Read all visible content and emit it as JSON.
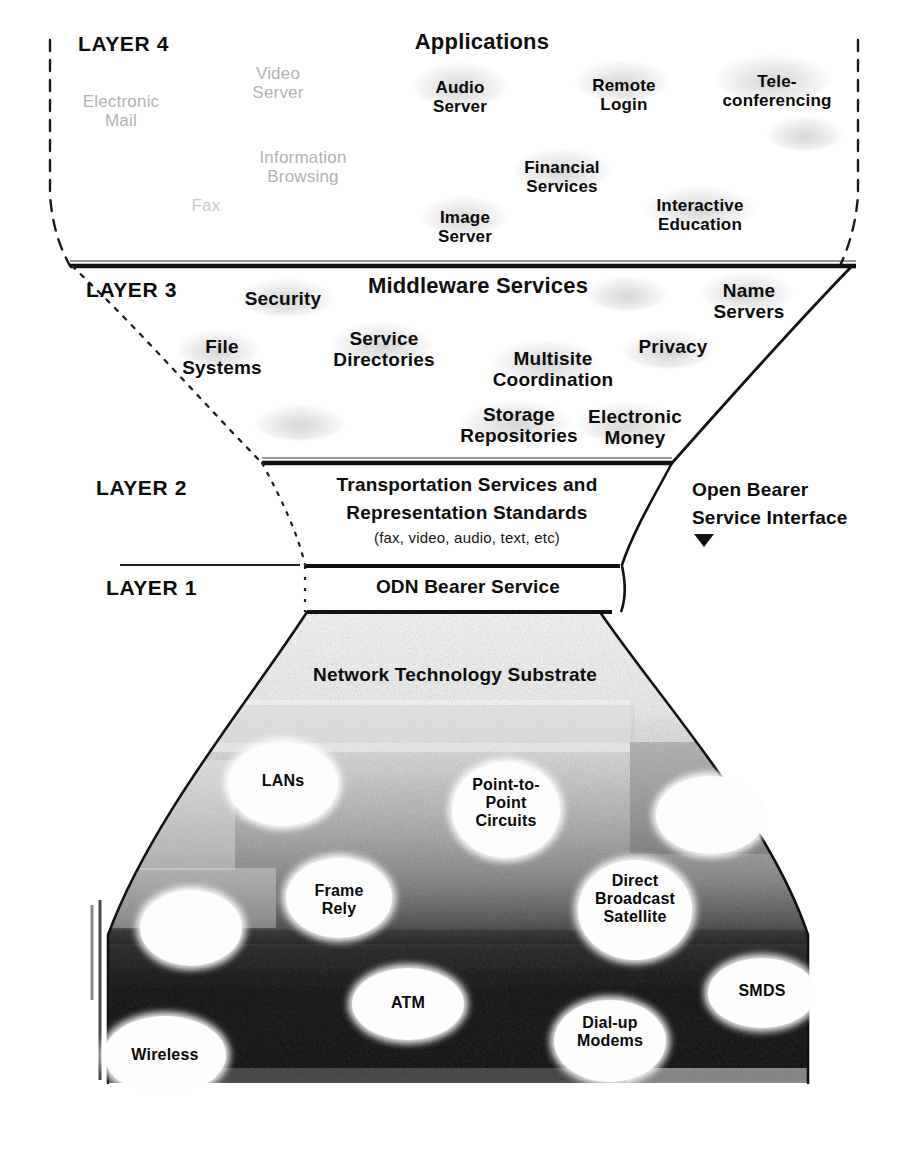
{
  "diagram": {
    "colors": {
      "ink": "#0d0d0d",
      "faint_text": "#b3b3b3",
      "rule": "#111111",
      "substrate_light": "#dcdcdc",
      "substrate_dark": "#151515"
    }
  },
  "layer4": {
    "tag": "LAYER 4",
    "header": "Applications",
    "apps_bold": [
      {
        "label": "Audio\nServer"
      },
      {
        "label": "Remote\nLogin"
      },
      {
        "label": "Tele-\nconferencing"
      },
      {
        "label": "Financial\nServices"
      },
      {
        "label": "Image\nServer"
      },
      {
        "label": "Interactive\nEducation"
      }
    ],
    "apps_faint": [
      {
        "label": "Video\nServer"
      },
      {
        "label": "Electronic\nMail"
      },
      {
        "label": "Information\nBrowsing"
      },
      {
        "label": "Fax"
      }
    ]
  },
  "layer3": {
    "tag": "LAYER 3",
    "header": "Middleware Services",
    "services": [
      {
        "label": "Security"
      },
      {
        "label": "Name\nServers"
      },
      {
        "label": "File\nSystems"
      },
      {
        "label": "Service\nDirectories"
      },
      {
        "label": "Multisite\nCoordination"
      },
      {
        "label": "Privacy"
      },
      {
        "label": "Storage\nRepositories"
      },
      {
        "label": "Electronic\nMoney"
      }
    ]
  },
  "layer2": {
    "tag": "LAYER 2",
    "title_line1": "Transportation Services and",
    "title_line2": "Representation Standards",
    "subtitle": "(fax, video, audio, text, etc)"
  },
  "layer1": {
    "tag": "LAYER 1",
    "title": "ODN Bearer Service"
  },
  "annotation": {
    "open_bearer_line1": "Open Bearer",
    "open_bearer_line2": "Service Interface",
    "arrow_icon": "down-triangle-icon"
  },
  "substrate": {
    "header": "Network Technology Substrate",
    "technologies": [
      {
        "label": "LANs"
      },
      {
        "label": "Point-to-\nPoint\nCircuits"
      },
      {
        "label": "Frame\nRely"
      },
      {
        "label": "Direct\nBroadcast\nSatellite"
      },
      {
        "label": "ATM"
      },
      {
        "label": "Wireless"
      },
      {
        "label": "Dial-up\nModems"
      },
      {
        "label": "SMDS"
      },
      {
        "label": ""
      },
      {
        "label": ""
      }
    ]
  }
}
